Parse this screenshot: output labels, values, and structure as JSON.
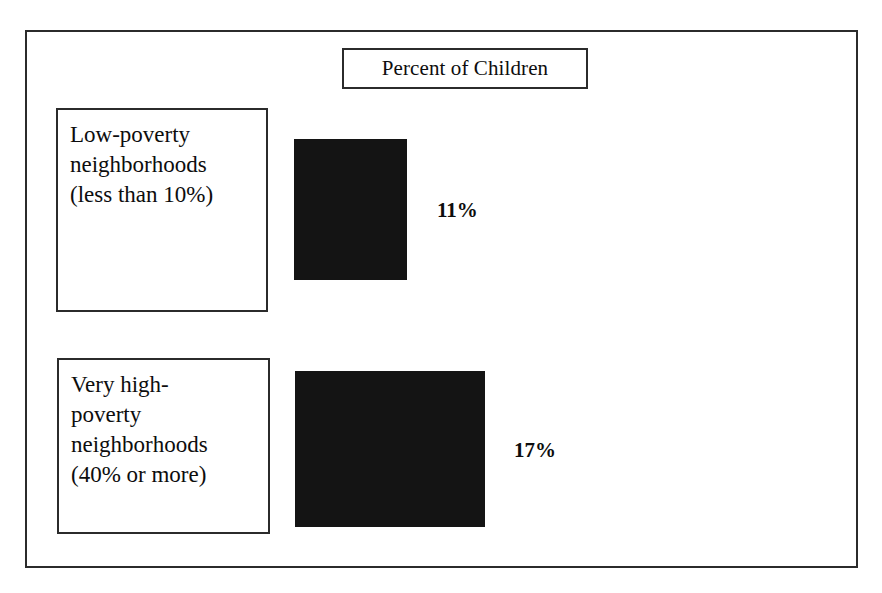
{
  "figure": {
    "title": "Percent of Children",
    "frame_color": "#2b2b2b",
    "bar_color": "#141414",
    "background": "#ffffff"
  },
  "categories": [
    {
      "label": "Low-poverty\nneighborhoods\n(less than 10%)",
      "value_label": "11%"
    },
    {
      "label": "Very high-\npoverty\nneighborhoods\n(40% or more)",
      "value_label": "17%"
    }
  ],
  "chart_data": {
    "type": "bar",
    "title": "Percent of Children",
    "orientation": "vertical",
    "categories": [
      "Low-poverty neighborhoods (less than 10%)",
      "Very high-poverty neighborhoods (40% or more)"
    ],
    "values": [
      11,
      17
    ],
    "value_labels": [
      "11%",
      "17%"
    ],
    "xlabel": "",
    "ylabel": "Percent of Children",
    "ylim": [
      0,
      20
    ],
    "grid": false,
    "legend": "none",
    "series": [
      {
        "name": "Percent of Children",
        "values": [
          11,
          17
        ]
      }
    ]
  }
}
